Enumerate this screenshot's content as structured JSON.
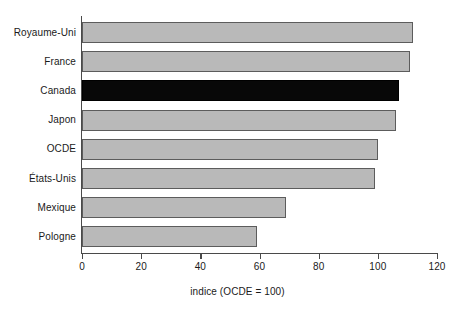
{
  "chart_data": {
    "type": "bar",
    "orientation": "horizontal",
    "title": "",
    "xlabel": "indice (OCDE = 100)",
    "ylabel": "",
    "categories": [
      "Royaume-Uni",
      "France",
      "Canada",
      "Japon",
      "OCDE",
      "États-Unis",
      "Mexique",
      "Pologne"
    ],
    "values": [
      112,
      111,
      107,
      106,
      100,
      99,
      69,
      59
    ],
    "xlim": [
      0,
      120
    ],
    "xticks": [
      0,
      20,
      40,
      60,
      80,
      100,
      120
    ],
    "xtick_labels": [
      "0",
      "20",
      "40",
      "60",
      "80",
      "100",
      "120"
    ],
    "grid": false,
    "legend": "none",
    "highlight_category": "Canada",
    "colors": {
      "bar_fill": "#b9b9b9",
      "bar_border": "#5c5c5c",
      "highlight_fill": "#080808",
      "highlight_border": "#000000",
      "axis": "#4a4a4a",
      "text": "#1a1a1a",
      "background": "#ffffff"
    }
  }
}
